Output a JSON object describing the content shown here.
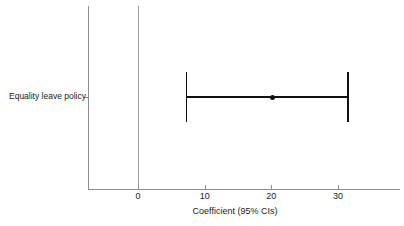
{
  "chart_data": {
    "type": "scatter",
    "title": "",
    "subtitle": "",
    "xlabel": "Coefficient (95% CIs)",
    "ylabel": "",
    "categories": [
      "Equality leave policy"
    ],
    "x_ticks": [
      0,
      10,
      20,
      30
    ],
    "x_tick_labels": [
      "0",
      "10",
      "20",
      "30"
    ],
    "xlim": [
      -7.5,
      39.3
    ],
    "grid": false,
    "legend": false,
    "reference_line": 0,
    "series": [
      {
        "name": "Equality leave policy",
        "estimate": 20.2,
        "ci_low": 7.3,
        "ci_high": 31.5
      }
    ],
    "annotations": []
  },
  "figure": {
    "y_axis_label": "Equality leave policy",
    "x_axis_title": "Coefficient (95% CIs)",
    "tick_0": "0",
    "tick_10": "10",
    "tick_20": "20",
    "tick_30": "30"
  },
  "colors": {
    "axis": "#8d8d8d",
    "reference_line": "#9a9a9a",
    "interval": "#111111",
    "marker": "#111111",
    "background": "#ffffff",
    "text": "#1a1a1a"
  }
}
